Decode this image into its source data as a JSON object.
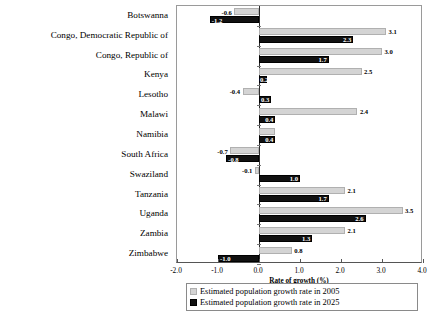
{
  "chart_data": {
    "type": "bar",
    "orientation": "horizontal",
    "title": "",
    "xlabel": "Rate of growth (%)",
    "ylabel": "",
    "xlim": [
      -2.0,
      4.0
    ],
    "xticks": [
      "-2.0",
      "-1.0",
      "0.0",
      "1.0",
      "2.0",
      "3.0",
      "4.0"
    ],
    "xtick_values": [
      -2.0,
      -1.0,
      0.0,
      1.0,
      2.0,
      3.0,
      4.0
    ],
    "grid": false,
    "legend_position": "bottom",
    "categories": [
      "Botswanna",
      "Congo, Democratic Republic of",
      "Congo, Republic of",
      "Kenya",
      "Lesotho",
      "Malawi",
      "Namibia",
      "South Africa",
      "Swaziland",
      "Tanzania",
      "Uganda",
      "Zambia",
      "Zimbabwe"
    ],
    "series": [
      {
        "name": "Estimated population growth rate in 2005",
        "color": "#d4d4d4",
        "values": [
          -0.6,
          3.1,
          3.0,
          2.5,
          -0.4,
          2.4,
          0.4,
          -0.7,
          -0.1,
          2.1,
          3.5,
          2.1,
          0.8
        ],
        "labels": [
          "-0.6",
          "3.1",
          "3.0",
          "2.5",
          "-0.4",
          "2.4",
          "",
          "-0.7",
          "-0.1",
          "2.1",
          "3.5",
          "2.1",
          "0.8"
        ]
      },
      {
        "name": "Estimated population growth rate in 2025",
        "color": "#111111",
        "values": [
          -1.2,
          2.3,
          1.7,
          0.2,
          0.3,
          0.4,
          0.4,
          -0.8,
          1.0,
          1.7,
          2.6,
          1.3,
          -1.0
        ],
        "labels": [
          "-1.2",
          "2.3",
          "1.7",
          "0.2",
          "0.3",
          "0.4",
          "0.4",
          "-0.8",
          "1.0",
          "1.7",
          "2.6",
          "1.3",
          "-1.0"
        ]
      }
    ]
  },
  "legend": {
    "entries": [
      "Estimated population growth rate in 2005",
      "Estimated population growth rate in 2025"
    ]
  },
  "axis": {
    "x_title": "Rate of growth (%)"
  }
}
